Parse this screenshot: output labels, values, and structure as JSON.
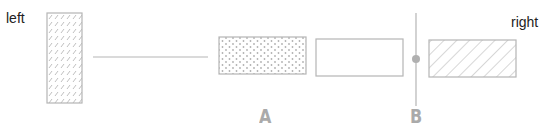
{
  "labels": {
    "left": "left",
    "right": "right",
    "a": "A",
    "b": "B"
  },
  "colors": {
    "stroke": "#b5b5b5",
    "pattern": "#b0b0b0",
    "label_gray": "#aaaaaa"
  },
  "elements": [
    {
      "id": "left-block",
      "fill": "diagonal-dashes",
      "x": 47,
      "y": 13,
      "w": 35,
      "h": 90
    },
    {
      "id": "connector-line",
      "x1": 93,
      "x2": 208,
      "y": 57
    },
    {
      "id": "dotted-block",
      "fill": "dots",
      "x": 219,
      "y": 37,
      "w": 87,
      "h": 37
    },
    {
      "id": "empty-block",
      "fill": "none",
      "x": 316,
      "y": 39,
      "w": 87,
      "h": 37
    },
    {
      "id": "divider-line-b",
      "x": 416,
      "y1": 13,
      "y2": 106
    },
    {
      "id": "divider-dot",
      "cx": 416,
      "cy": 59,
      "r": 4
    },
    {
      "id": "hatched-block",
      "fill": "diagonal-hatch",
      "x": 429,
      "y": 40,
      "w": 87,
      "h": 37
    }
  ]
}
